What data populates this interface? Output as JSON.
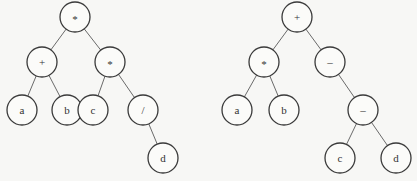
{
  "diagram": {
    "type": "expression-trees",
    "node_radius": 15,
    "colors": {
      "background": "#f7f7f5",
      "node_stroke": "#3a3a3a",
      "edge": "#6a6a6a",
      "text": "#333333"
    },
    "trees": [
      {
        "name": "left-tree",
        "nodes": [
          {
            "id": "L1",
            "label": "*",
            "x": 75,
            "y": 17
          },
          {
            "id": "L2",
            "label": "+",
            "x": 42,
            "y": 62
          },
          {
            "id": "L3",
            "label": "*",
            "x": 110,
            "y": 62
          },
          {
            "id": "L4",
            "label": "a",
            "x": 22,
            "y": 110
          },
          {
            "id": "L5",
            "label": "b",
            "x": 67,
            "y": 110
          },
          {
            "id": "L6",
            "label": "c",
            "x": 93,
            "y": 110
          },
          {
            "id": "L7",
            "label": "/",
            "x": 143,
            "y": 110
          },
          {
            "id": "L8",
            "label": "d",
            "x": 163,
            "y": 158
          }
        ],
        "edges": [
          [
            "L1",
            "L2"
          ],
          [
            "L1",
            "L3"
          ],
          [
            "L2",
            "L4"
          ],
          [
            "L2",
            "L5"
          ],
          [
            "L3",
            "L6"
          ],
          [
            "L3",
            "L7"
          ],
          [
            "L7",
            "L8"
          ]
        ]
      },
      {
        "name": "right-tree",
        "nodes": [
          {
            "id": "R1",
            "label": "+",
            "x": 297,
            "y": 17
          },
          {
            "id": "R2",
            "label": "*",
            "x": 264,
            "y": 62
          },
          {
            "id": "R3",
            "label": "–",
            "x": 330,
            "y": 62
          },
          {
            "id": "R4",
            "label": "a",
            "x": 237,
            "y": 110
          },
          {
            "id": "R5",
            "label": "b",
            "x": 284,
            "y": 110
          },
          {
            "id": "R6",
            "label": "–",
            "x": 363,
            "y": 110
          },
          {
            "id": "R7",
            "label": "c",
            "x": 340,
            "y": 158
          },
          {
            "id": "R8",
            "label": "d",
            "x": 396,
            "y": 158
          }
        ],
        "edges": [
          [
            "R1",
            "R2"
          ],
          [
            "R1",
            "R3"
          ],
          [
            "R2",
            "R4"
          ],
          [
            "R2",
            "R5"
          ],
          [
            "R3",
            "R6"
          ],
          [
            "R6",
            "R7"
          ],
          [
            "R6",
            "R8"
          ]
        ]
      }
    ]
  }
}
